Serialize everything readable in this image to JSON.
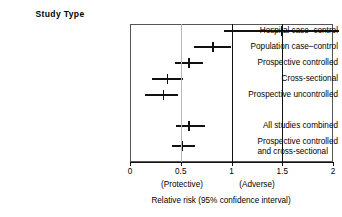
{
  "figure": {
    "column_header": "Study Type",
    "axis_title": "Relative risk (95% confidence interval)",
    "zone_left": "(Protective)",
    "zone_right": "(Adverse)"
  },
  "chart_data": {
    "type": "scatter",
    "subtype": "forest-plot",
    "title": "",
    "xlabel": "Relative risk (95% confidence interval)",
    "ylabel": "Study Type",
    "xlim": [
      0,
      2.1
    ],
    "xticks": [
      0,
      0.5,
      1,
      1.5,
      2
    ],
    "xtick_labels": [
      "0",
      "0.5",
      "1",
      "1.5",
      "2"
    ],
    "grid": false,
    "legend": "none",
    "reference_lines": [
      {
        "value": 0.5,
        "color": "#b8b8b8",
        "style": "solid"
      },
      {
        "value": 1.0,
        "color": "#111111",
        "style": "solid"
      },
      {
        "value": 1.5,
        "color": "#111111",
        "style": "solid"
      }
    ],
    "annotations": [
      {
        "text": "(Protective)",
        "x": 0.5,
        "position": "below-axis"
      },
      {
        "text": "(Adverse)",
        "x": 1.35,
        "position": "below-axis"
      }
    ],
    "categories": [
      "Hospital case–control",
      "Population case–control",
      "Prospective controlled",
      "Cross-sectional",
      "Prospective uncontrolled",
      "All studies combined",
      "Prospective controlled and cross-sectional"
    ],
    "rows": [
      {
        "label": "Hospital case–control",
        "label_line1": "Hospital case–control",
        "label_line2": "",
        "group": "individual",
        "estimate": 1.5,
        "ci_low": 0.93,
        "ci_high": 2.06,
        "ci_high_clipped": true
      },
      {
        "label": "Population case–control",
        "label_line1": "Population case–control",
        "label_line2": "",
        "group": "individual",
        "estimate": 0.82,
        "ci_low": 0.63,
        "ci_high": 1.0,
        "ci_high_clipped": false
      },
      {
        "label": "Prospective controlled",
        "label_line1": "Prospective controlled",
        "label_line2": "",
        "group": "individual",
        "estimate": 0.58,
        "ci_low": 0.44,
        "ci_high": 0.72,
        "ci_high_clipped": false
      },
      {
        "label": "Cross-sectional",
        "label_line1": "Cross-sectional",
        "label_line2": "",
        "group": "individual",
        "estimate": 0.37,
        "ci_low": 0.22,
        "ci_high": 0.52,
        "ci_high_clipped": false
      },
      {
        "label": "Prospective uncontrolled",
        "label_line1": "Prospective uncontrolled",
        "label_line2": "",
        "group": "individual",
        "estimate": 0.33,
        "ci_low": 0.15,
        "ci_high": 0.47,
        "ci_high_clipped": false
      },
      {
        "label": "All studies combined",
        "label_line1": "All studies combined",
        "label_line2": "",
        "group": "summary",
        "estimate": 0.58,
        "ci_low": 0.45,
        "ci_high": 0.74,
        "ci_high_clipped": false
      },
      {
        "label": "Prospective controlled and cross-sectional",
        "label_line1": "Prospective controlled",
        "label_line2": "and cross-sectional",
        "group": "summary",
        "estimate": 0.51,
        "ci_low": 0.41,
        "ci_high": 0.64,
        "ci_high_clipped": false
      }
    ]
  }
}
